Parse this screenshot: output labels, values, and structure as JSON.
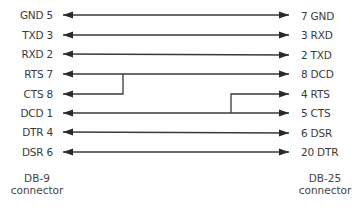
{
  "diagram": {
    "left_connector": {
      "name": "DB-9",
      "subtitle": "connector",
      "pins": [
        {
          "label": "GND 5",
          "y": 15
        },
        {
          "label": "TXD 3",
          "y": 35
        },
        {
          "label": "RXD 2",
          "y": 54
        },
        {
          "label": "RTS 7",
          "y": 74
        },
        {
          "label": "CTS 8",
          "y": 93
        },
        {
          "label": "DCD 1",
          "y": 113
        },
        {
          "label": "DTR 4",
          "y": 132
        },
        {
          "label": "DSR 6",
          "y": 152
        }
      ]
    },
    "right_connector": {
      "name": "DB-25",
      "subtitle": "connector",
      "pins": [
        {
          "label": "7 GND",
          "y": 15
        },
        {
          "label": "3 RXD",
          "y": 35
        },
        {
          "label": "2 TXD",
          "y": 55
        },
        {
          "label": "8 DCD",
          "y": 74
        },
        {
          "label": "4 RTS",
          "y": 94
        },
        {
          "label": "5 CTS",
          "y": 113
        },
        {
          "label": "6 DSR",
          "y": 133
        },
        {
          "label": "20 DTR",
          "y": 152
        }
      ]
    },
    "connections": [
      {
        "from": "GND 5",
        "to": "7 GND"
      },
      {
        "from": "TXD 3",
        "to": "3 RXD"
      },
      {
        "from": "RXD 2",
        "to": "2 TXD"
      },
      {
        "from": "RTS 7 + CTS 8",
        "to": "8 DCD",
        "note": "RTS 7 and CTS 8 bridged on DB-9 side"
      },
      {
        "from": "DCD 1",
        "to": "5 CTS + 4 RTS",
        "note": "4 RTS and 5 CTS bridged on DB-25 side"
      },
      {
        "from": "DTR 4",
        "to": "6 DSR"
      },
      {
        "from": "DSR 6",
        "to": "20 DTR"
      }
    ],
    "line_color": "#3a3a3a"
  }
}
